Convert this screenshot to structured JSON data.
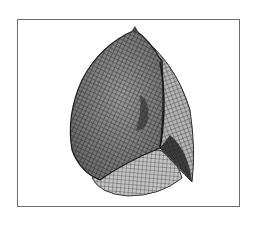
{
  "figure": {
    "colors": {
      "background": "#ffffff",
      "frame_border": "#6e6e6e",
      "mesh_dark": "#2a2a2a",
      "mesh_mid": "#6a6a6a",
      "mesh_light": "#bdbdbd"
    },
    "frame": {
      "x": 17,
      "y": 19,
      "width": 223,
      "height": 188
    }
  }
}
